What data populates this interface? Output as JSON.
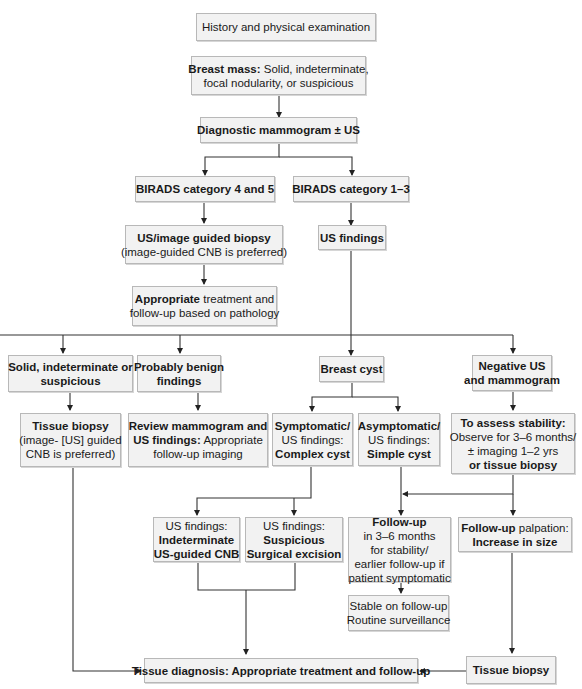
{
  "flowchart": {
    "nodes": {
      "history": {
        "lines": [
          {
            "bold": "",
            "normal": "History and physical examination"
          }
        ]
      },
      "breast_mass": {
        "lines": [
          {
            "bold": "Breast mass:",
            "normal": " Solid, indeterminate,"
          },
          {
            "bold": "",
            "normal": "focal nodularity, or suspicious"
          }
        ]
      },
      "diag_mammo": {
        "lines": [
          {
            "bold": "Diagnostic mammogram ± US",
            "normal": ""
          }
        ]
      },
      "birads_45": {
        "lines": [
          {
            "bold": "BIRADS category 4 and 5",
            "normal": ""
          }
        ]
      },
      "birads_13": {
        "lines": [
          {
            "bold": "BIRADS category 1–3",
            "normal": ""
          }
        ]
      },
      "us_guided_biopsy": {
        "lines": [
          {
            "bold": "US/image guided biopsy",
            "normal": ""
          },
          {
            "bold": "",
            "normal": "(image-guided CNB is preferred)"
          }
        ]
      },
      "us_findings": {
        "lines": [
          {
            "bold": "US findings",
            "normal": ""
          }
        ]
      },
      "appropriate_treatment": {
        "lines": [
          {
            "bold": "Appropriate",
            "normal": " treatment and"
          },
          {
            "bold": "",
            "normal": "follow-up based on pathology"
          }
        ]
      },
      "solid_indeterminate": {
        "lines": [
          {
            "bold": "Solid, indeterminate or",
            "normal": ""
          },
          {
            "bold": "suspicious",
            "normal": ""
          }
        ]
      },
      "probably_benign": {
        "lines": [
          {
            "bold": "Probably benign",
            "normal": ""
          },
          {
            "bold": "findings",
            "normal": ""
          }
        ]
      },
      "breast_cyst": {
        "lines": [
          {
            "bold": "Breast cyst",
            "normal": ""
          }
        ]
      },
      "negative_us": {
        "lines": [
          {
            "bold": "Negative US",
            "normal": ""
          },
          {
            "bold": "and mammogram",
            "normal": ""
          }
        ]
      },
      "tissue_biopsy_left": {
        "lines": [
          {
            "bold": "Tissue biopsy",
            "normal": ""
          },
          {
            "bold": "",
            "normal": "(image- [US] guided"
          },
          {
            "bold": "",
            "normal": "CNB is preferred)"
          }
        ]
      },
      "review_mammo": {
        "lines": [
          {
            "bold": "Review mammogram and",
            "normal": ""
          },
          {
            "bold": "US findings:",
            "normal": " Appropriate"
          },
          {
            "bold": "",
            "normal": "follow-up imaging"
          }
        ]
      },
      "symptomatic": {
        "lines": [
          {
            "bold": "Symptomatic/",
            "normal": ""
          },
          {
            "bold": "",
            "normal": "US findings:"
          },
          {
            "bold": "Complex cyst",
            "normal": ""
          }
        ]
      },
      "asymptomatic": {
        "lines": [
          {
            "bold": "Asymptomatic/",
            "normal": ""
          },
          {
            "bold": "",
            "normal": "US findings:"
          },
          {
            "bold": "Simple cyst",
            "normal": ""
          }
        ]
      },
      "assess_stability": {
        "lines": [
          {
            "bold": "To assess stability:",
            "normal": ""
          },
          {
            "bold": "",
            "normal": "Observe for 3–6 months/"
          },
          {
            "bold": "",
            "normal": "± imaging 1–2 yrs"
          },
          {
            "bold": "or tissue biopsy",
            "normal": ""
          }
        ]
      },
      "indeterminate_cnb": {
        "lines": [
          {
            "bold": "",
            "normal": "US findings:"
          },
          {
            "bold": "Indeterminate",
            "normal": ""
          },
          {
            "bold": "US-guided CNB",
            "normal": ""
          }
        ]
      },
      "suspicious_excision": {
        "lines": [
          {
            "bold": "",
            "normal": "US findings:"
          },
          {
            "bold": "Suspicious",
            "normal": ""
          },
          {
            "bold": "Surgical excision",
            "normal": ""
          }
        ]
      },
      "follow_up": {
        "lines": [
          {
            "bold": "Follow-up",
            "normal": ""
          },
          {
            "bold": "",
            "normal": "in 3–6 months"
          },
          {
            "bold": "",
            "normal": "for stability/"
          },
          {
            "bold": "",
            "normal": "earlier follow-up if"
          },
          {
            "bold": "",
            "normal": "patient symptomatic"
          }
        ]
      },
      "follow_up_palpation": {
        "lines": [
          {
            "bold": "Follow-up",
            "normal": " palpation:"
          },
          {
            "bold": "Increase in size",
            "normal": ""
          }
        ]
      },
      "stable": {
        "lines": [
          {
            "bold": "",
            "normal": "Stable on follow-up"
          },
          {
            "bold": "",
            "normal": "Routine surveillance"
          }
        ]
      },
      "tissue_diagnosis": {
        "lines": [
          {
            "bold": "Tissue diagnosis: Appropriate treatment and follow-up",
            "normal": ""
          }
        ]
      },
      "tissue_biopsy_right": {
        "lines": [
          {
            "bold": "Tissue biopsy",
            "normal": ""
          }
        ]
      }
    }
  }
}
